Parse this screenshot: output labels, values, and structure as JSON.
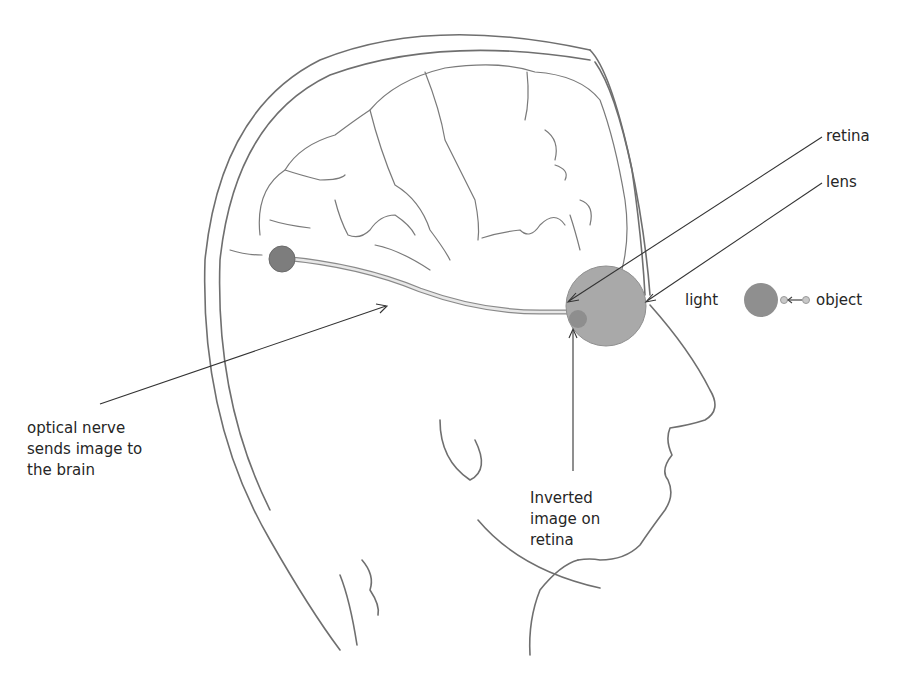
{
  "diagram": {
    "labels": {
      "retina": "retina",
      "lens": "lens",
      "light": "light",
      "object": "object",
      "optical_nerve": [
        "optical nerve",
        "sends image to",
        "the brain"
      ],
      "inverted_image": [
        "Inverted",
        "image on",
        "retina"
      ]
    },
    "colors": {
      "sketch_line": "#6f6f6f",
      "eyeball_fill": "#a9a9a9",
      "image_dot": "#8e8e8e",
      "light_circle": "#8f8f8f",
      "brain_dot": "#7d7d7d",
      "label_text": "#262626",
      "leader_line": "#333333"
    }
  }
}
